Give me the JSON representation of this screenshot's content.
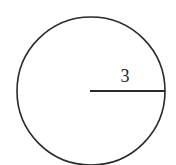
{
  "diagram": {
    "shape": "circle",
    "radius_label": "3",
    "stroke_color": "#2a2a2a",
    "background": "#ffffff"
  }
}
